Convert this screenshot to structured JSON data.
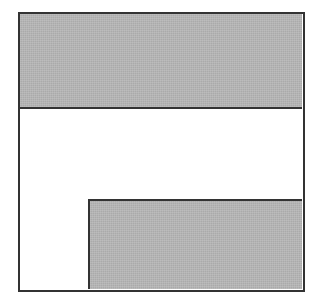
{
  "figure": {
    "kind": "shaded-region-diagram",
    "caption": "",
    "title": "",
    "background_color": "#ffffff"
  },
  "colors": {
    "shaded_fill": "#b6b6b6",
    "unshaded_fill": "#ffffff",
    "outline": "#333333",
    "page_background": "#ffffff"
  },
  "outer_shape": {
    "name": "square",
    "label": "",
    "outline_color": "#333333",
    "outline_width_px": 2.5,
    "x": 18,
    "y": 12,
    "width": 287,
    "height": 280
  },
  "regions": [
    {
      "id": "top-band",
      "label": "",
      "state": "shaded",
      "fill": "#b6b6b6",
      "x": 0,
      "y": 0,
      "width": 282,
      "height": 95
    },
    {
      "id": "middle-band",
      "label": "",
      "state": "unshaded",
      "fill": "#ffffff",
      "x": 0,
      "y": 95,
      "width": 282,
      "height": 90
    },
    {
      "id": "bottom-left-notch",
      "label": "",
      "state": "unshaded",
      "fill": "#ffffff",
      "x": 0,
      "y": 185,
      "width": 68,
      "height": 90
    },
    {
      "id": "bottom-right-band",
      "label": "",
      "state": "shaded",
      "fill": "#b6b6b6",
      "x": 68,
      "y": 185,
      "width": 214,
      "height": 90
    }
  ]
}
